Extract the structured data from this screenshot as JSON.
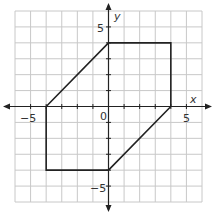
{
  "chart_data": {
    "type": "line",
    "title": "",
    "xlabel": "x",
    "ylabel": "y",
    "xlim": [
      -6,
      6
    ],
    "ylim": [
      -6,
      6
    ],
    "grid": true,
    "tick_labels": {
      "x": [
        "-5",
        "0",
        "5"
      ],
      "y": [
        "5",
        "-5"
      ]
    },
    "series": [
      {
        "name": "polygon",
        "closed": true,
        "points": [
          [
            0,
            4
          ],
          [
            4,
            4
          ],
          [
            4,
            0
          ],
          [
            0,
            -4
          ],
          [
            -4,
            -4
          ],
          [
            -4,
            0
          ]
        ]
      }
    ]
  },
  "labels": {
    "x_axis": "x",
    "y_axis": "y",
    "x_neg5": "−5",
    "x_5": "5",
    "origin": "0",
    "y_5": "5",
    "y_neg5": "−5"
  },
  "colors": {
    "grid": "#c8c8c8",
    "axis": "#222222",
    "polygon": "#222222"
  }
}
